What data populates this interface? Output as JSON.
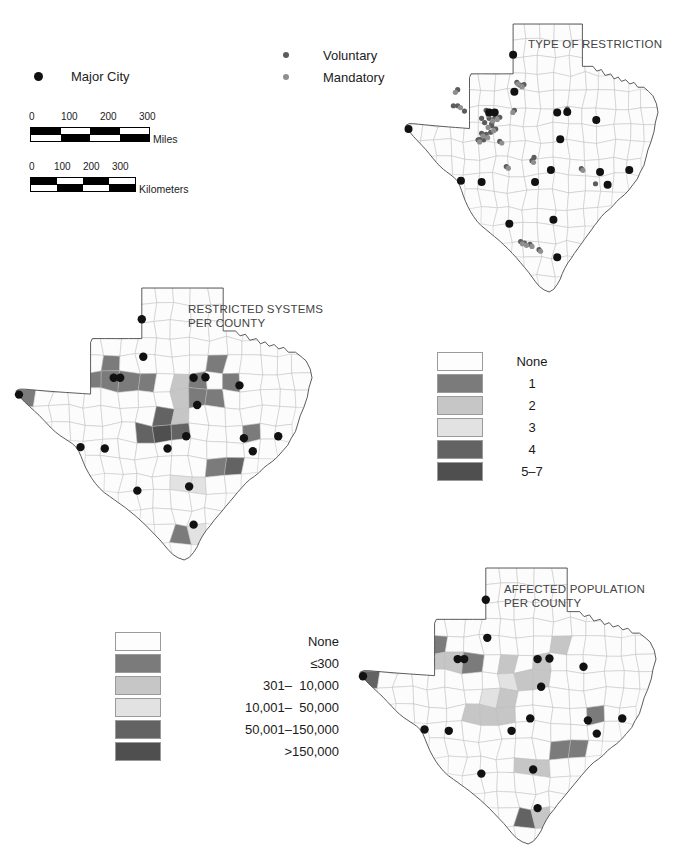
{
  "figure": {
    "kind": "three-panel choropleth + point map of Texas counties",
    "background": "#ffffff"
  },
  "point_legend": {
    "major_city": {
      "label": "Major City",
      "icon": "filled-circle-icon",
      "color": "#111111",
      "size_px": 9
    },
    "restriction_types": [
      {
        "label": "Voluntary",
        "icon": "filled-circle-icon",
        "color": "#5c5c5c",
        "size_px": 6
      },
      {
        "label": "Mandatory",
        "icon": "filled-circle-icon",
        "color": "#8f8f8f",
        "size_px": 6
      }
    ]
  },
  "scale_bars": [
    {
      "unit": "Miles",
      "ticks": [
        "0",
        "100",
        "200",
        "300"
      ],
      "tick_positions_pct": [
        0,
        33.33,
        66.67,
        100
      ],
      "bar_width_px": 118,
      "segments": 4
    },
    {
      "unit": "Kilometers",
      "ticks": [
        "0",
        "100",
        "200",
        "300"
      ],
      "tick_positions_pct": [
        0,
        26,
        52,
        78
      ],
      "bar_width_px": 104,
      "segments": 4
    }
  ],
  "maps": [
    {
      "id": "type-of-restriction",
      "title": "TYPE OF RESTRICTION",
      "kind": "point",
      "description": "Texas counties outline with point symbols for voluntary and mandatory water-use restrictions plus major cities"
    },
    {
      "id": "restricted-systems-per-county",
      "title": "RESTRICTED SYSTEMS\nPER COUNTY",
      "kind": "choropleth",
      "description": "Texas counties shaded by number of restricted water systems"
    },
    {
      "id": "affected-population-per-county",
      "title": "AFFECTED POPULATION\nPER COUNTY",
      "kind": "choropleth",
      "description": "Texas counties shaded by population affected by water restrictions"
    }
  ],
  "legend_restricted_systems": {
    "title": "",
    "classes": [
      {
        "label": "None",
        "color": "#fdfdfd"
      },
      {
        "label": "1",
        "color": "#7b7b7b"
      },
      {
        "label": "2",
        "color": "#c6c6c6"
      },
      {
        "label": "3",
        "color": "#e2e2e2"
      },
      {
        "label": "4",
        "color": "#636363"
      },
      {
        "label": "5–7",
        "color": "#4f4f4f"
      }
    ]
  },
  "legend_affected_population": {
    "title": "",
    "classes": [
      {
        "label": "None",
        "color": "#fdfdfd"
      },
      {
        "label": "≤300",
        "color": "#7b7b7b"
      },
      {
        "label": "301–  10,000",
        "color": "#c6c6c6"
      },
      {
        "label": "10,001–  50,000",
        "color": "#e2e2e2"
      },
      {
        "label": "50,001–150,000",
        "color": "#636363"
      },
      {
        "label": ">150,000",
        "color": "#4f4f4f"
      }
    ]
  },
  "chart_data": {
    "type": "map",
    "panels": [
      {
        "name": "TYPE OF RESTRICTION",
        "series": [
          {
            "name": "Voluntary",
            "color": "#5c5c5c",
            "symbol": "circle",
            "count_visible": 34
          },
          {
            "name": "Mandatory",
            "color": "#8f8f8f",
            "symbol": "circle",
            "count_visible": 21
          },
          {
            "name": "Major City",
            "color": "#111111",
            "symbol": "circle",
            "count_visible": 25
          }
        ]
      },
      {
        "name": "RESTRICTED SYSTEMS PER COUNTY",
        "classes": [
          "None",
          "1",
          "2",
          "3",
          "4",
          "5–7"
        ],
        "colors": [
          "#fdfdfd",
          "#7b7b7b",
          "#c6c6c6",
          "#e2e2e2",
          "#636363",
          "#4f4f4f"
        ]
      },
      {
        "name": "AFFECTED POPULATION PER COUNTY",
        "classes": [
          "None",
          "≤300",
          "301– 10,000",
          "10,001– 50,000",
          "50,001–150,000",
          ">150,000"
        ],
        "colors": [
          "#fdfdfd",
          "#7b7b7b",
          "#c6c6c6",
          "#e2e2e2",
          "#636363",
          "#4f4f4f"
        ]
      }
    ]
  }
}
